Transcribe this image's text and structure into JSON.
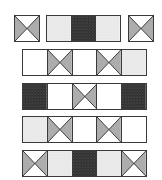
{
  "colors": {
    "outline": "#3a3a3a",
    "white": "#ffffff",
    "light": "#e6e6e6",
    "gray": "#a9a9a9",
    "dark": "#3c3c3c"
  },
  "legend": {
    "blank": "white square",
    "light": "light stippled square",
    "dark": "dark stippled square",
    "x": "square with diagonals, side triangles shaded"
  },
  "rows": [
    {
      "label": "row 1",
      "strips": [
        {
          "x": 14,
          "y": 15,
          "cells": [
            "x"
          ]
        },
        {
          "x": 46,
          "y": 15,
          "cells": [
            "light",
            "dark",
            "light"
          ]
        },
        {
          "x": 128,
          "y": 15,
          "cells": [
            "x"
          ]
        }
      ]
    },
    {
      "label": "row 2",
      "strips": [
        {
          "x": 22,
          "y": 49,
          "cells": [
            "blank",
            "x",
            "blank",
            "x",
            "light"
          ]
        }
      ]
    },
    {
      "label": "row 3",
      "strips": [
        {
          "x": 22,
          "y": 83,
          "cells": [
            "dark",
            "blank",
            "x",
            "blank",
            "dark"
          ]
        }
      ]
    },
    {
      "label": "row 4",
      "strips": [
        {
          "x": 22,
          "y": 116,
          "cells": [
            "light",
            "x",
            "blank",
            "x",
            "blank"
          ]
        }
      ]
    },
    {
      "label": "row 5",
      "strips": [
        {
          "x": 22,
          "y": 150,
          "cells": [
            "x",
            "light",
            "dark",
            "light",
            "x"
          ]
        }
      ]
    }
  ]
}
